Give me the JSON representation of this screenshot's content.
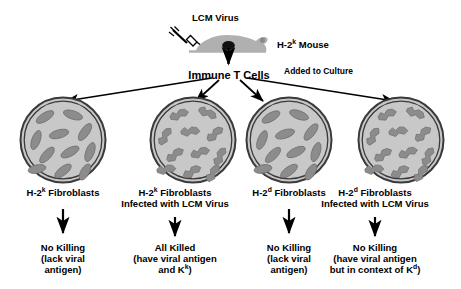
{
  "figure": {
    "background_color": "#ffffff",
    "ink_color": "#000000",
    "dish_fill_color": "#c8c8c8",
    "dish_ring_color": "#3a3a3a",
    "cell_fill_color": "#8c8c8c",
    "mouse_fill_color": "#b0b0b0"
  },
  "top": {
    "virus_label": "LCM Virus",
    "mouse_label_pre": "H-2",
    "mouse_label_sup": "k",
    "mouse_label_post": " Mouse",
    "tcells_label": "Immune T Cells",
    "added_label": "Added to Culture",
    "syringe_icon": "syringe-icon",
    "mouse_icon": "mouse-icon"
  },
  "columns": [
    {
      "id": "col-1",
      "dish_name": "dish-h2k-uninfected",
      "cell_style": "smooth-oval",
      "cell_count": 11,
      "label_line1_pre": "H-2",
      "label_line1_sup": "k",
      "label_line1_post": " Fibroblasts",
      "label_line2": "",
      "outcome_line1": "No Killing",
      "outcome_line2": "(lack viral",
      "outcome_line3_pre": "antigen)",
      "outcome_line3_sup": "",
      "outcome_line3_post": ""
    },
    {
      "id": "col-2",
      "dish_name": "dish-h2k-infected",
      "cell_style": "jagged-lysed",
      "cell_count": 11,
      "label_line1_pre": "H-2",
      "label_line1_sup": "k",
      "label_line1_post": " Fibroblasts",
      "label_line2": "Infected with LCM Virus",
      "outcome_line1": "All Killed",
      "outcome_line2": "(have viral antigen",
      "outcome_line3_pre": "and K",
      "outcome_line3_sup": "k",
      "outcome_line3_post": ")"
    },
    {
      "id": "col-3",
      "dish_name": "dish-h2d-uninfected",
      "cell_style": "smooth-oval",
      "cell_count": 11,
      "label_line1_pre": "H-2",
      "label_line1_sup": "d",
      "label_line1_post": " Fibroblasts",
      "label_line2": "",
      "outcome_line1": "No Killing",
      "outcome_line2": "(lack viral",
      "outcome_line3_pre": "antigen)",
      "outcome_line3_sup": "",
      "outcome_line3_post": ""
    },
    {
      "id": "col-4",
      "dish_name": "dish-h2d-infected",
      "cell_style": "jagged-lysed",
      "cell_count": 11,
      "label_line1_pre": "H-2",
      "label_line1_sup": "d",
      "label_line1_post": " Fibroblasts",
      "label_line2": "Infected with LCM Virus",
      "outcome_line1": "No Killing",
      "outcome_line2": "(have viral antigen",
      "outcome_line3_pre": "but in context of K",
      "outcome_line3_sup": "d",
      "outcome_line3_post": ")"
    }
  ]
}
